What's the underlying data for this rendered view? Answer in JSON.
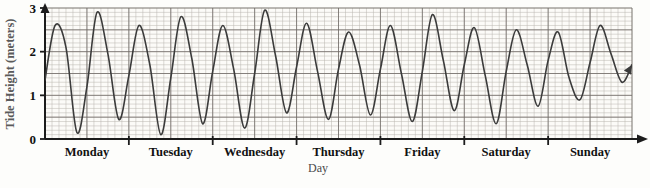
{
  "chart_data": {
    "type": "line",
    "title": "",
    "xlabel": "Day",
    "ylabel": "Tide Height (meters)",
    "ylim": [
      0,
      3
    ],
    "yticks": [
      0,
      1,
      2,
      3
    ],
    "ytick_labels": [
      "0",
      "1",
      "2",
      "3"
    ],
    "categories": [
      "Monday",
      "Tuesday",
      "Wednesday",
      "Thursday",
      "Friday",
      "Saturday",
      "Sunday"
    ],
    "xlim": [
      0,
      7
    ],
    "grid": true,
    "grid_minor_spacing_days": 0.0833,
    "legend": "none",
    "series": [
      {
        "name": "Tide Height",
        "description": "Damped sinusoidal tide curve, about two full cycles per day, amplitude decreasing and mean level slowly rising over the week",
        "x": [
          0.0,
          0.12,
          0.25,
          0.38,
          0.5,
          0.62,
          0.75,
          0.88,
          1.0,
          1.12,
          1.25,
          1.38,
          1.5,
          1.62,
          1.75,
          1.88,
          2.0,
          2.12,
          2.25,
          2.38,
          2.5,
          2.62,
          2.75,
          2.88,
          3.0,
          3.12,
          3.25,
          3.38,
          3.5,
          3.62,
          3.75,
          3.88,
          4.0,
          4.12,
          4.25,
          4.38,
          4.5,
          4.62,
          4.75,
          4.88,
          5.0,
          5.12,
          5.25,
          5.38,
          5.5,
          5.62,
          5.75,
          5.88,
          6.0,
          6.12,
          6.25,
          6.38,
          6.5,
          6.62,
          6.75,
          6.88,
          7.0
        ],
        "y": [
          1.35,
          2.6,
          2.1,
          0.15,
          1.2,
          2.9,
          1.95,
          0.45,
          1.45,
          2.6,
          1.7,
          0.1,
          1.4,
          2.8,
          1.85,
          0.35,
          1.55,
          2.6,
          1.6,
          0.25,
          1.5,
          2.95,
          1.9,
          0.6,
          1.65,
          2.65,
          1.55,
          0.45,
          1.6,
          2.45,
          1.7,
          0.55,
          1.6,
          2.6,
          1.5,
          0.4,
          1.55,
          2.85,
          1.8,
          0.65,
          1.7,
          2.55,
          1.45,
          0.35,
          1.55,
          2.5,
          1.7,
          0.75,
          1.8,
          2.45,
          1.4,
          0.9,
          1.75,
          2.6,
          1.95,
          1.3,
          1.7
        ]
      }
    ],
    "approx_peaks": [
      2.6,
      2.9,
      2.6,
      2.8,
      2.6,
      2.95,
      2.65,
      2.45,
      2.6,
      2.85,
      2.55,
      2.5,
      2.45,
      2.6
    ],
    "approx_troughs": [
      0.15,
      0.45,
      0.1,
      0.35,
      0.25,
      0.6,
      0.45,
      0.55,
      0.4,
      0.65,
      0.35,
      0.75,
      0.9,
      1.3
    ]
  },
  "axes": {
    "y_axis_name": "y-axis",
    "x_axis_name": "x-axis",
    "y_arrow": "up-arrow",
    "x_arrow": "right-arrow"
  },
  "curve": {
    "end_marker": "arrow-head",
    "color": "#3b3b3b"
  },
  "colors": {
    "grid_minor": "#b9b4ae",
    "grid_major": "#6e6a66",
    "axis": "#1c1c1c",
    "curve": "#3b3b3b",
    "plot_bg": "#fcfbf8",
    "label": "#111111",
    "axis_title": "#5a5a5a"
  }
}
